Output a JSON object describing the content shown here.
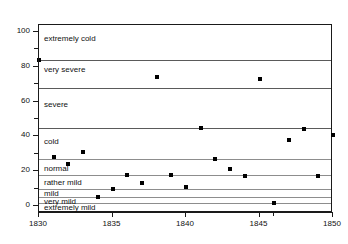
{
  "chart_data": {
    "type": "scatter",
    "title": "",
    "xlabel": "",
    "ylabel": "",
    "xlim": [
      1830,
      1850
    ],
    "ylim": [
      -4,
      104
    ],
    "grid": true,
    "legend": "none",
    "x_ticks": [
      1830,
      1835,
      1840,
      1845,
      1850
    ],
    "x_tick_labels": [
      "1830",
      "1835",
      "1840",
      "1845",
      "1850"
    ],
    "x_minor_ticks": [
      1846
    ],
    "y_ticks": [
      0,
      20,
      40,
      60,
      80,
      100
    ],
    "y_tick_labels": [
      "0",
      "20",
      "40",
      "60",
      "80",
      "100"
    ],
    "y_minor_ticks": [
      10,
      30,
      50,
      70,
      90
    ],
    "x": [
      1830,
      1831,
      1832,
      1833,
      1834,
      1835,
      1836,
      1837,
      1838,
      1839,
      1840,
      1841,
      1842,
      1843,
      1844,
      1845,
      1846,
      1847,
      1848,
      1849,
      1850
    ],
    "values": [
      84,
      28,
      24,
      31,
      5,
      10,
      18,
      13,
      74,
      18,
      11,
      45,
      27,
      21,
      17,
      73,
      2,
      38,
      44,
      17,
      41
    ],
    "points": [
      {
        "x": 1830,
        "y": 84
      },
      {
        "x": 1831,
        "y": 28
      },
      {
        "x": 1832,
        "y": 24
      },
      {
        "x": 1833,
        "y": 31
      },
      {
        "x": 1834,
        "y": 5
      },
      {
        "x": 1835,
        "y": 10
      },
      {
        "x": 1836,
        "y": 18
      },
      {
        "x": 1837,
        "y": 13
      },
      {
        "x": 1838,
        "y": 74
      },
      {
        "x": 1839,
        "y": 18
      },
      {
        "x": 1840,
        "y": 11
      },
      {
        "x": 1841,
        "y": 45
      },
      {
        "x": 1842,
        "y": 27
      },
      {
        "x": 1843,
        "y": 21
      },
      {
        "x": 1844,
        "y": 17
      },
      {
        "x": 1845,
        "y": 73
      },
      {
        "x": 1846,
        "y": 2
      },
      {
        "x": 1847,
        "y": 38
      },
      {
        "x": 1848,
        "y": 44
      },
      {
        "x": 1849,
        "y": 17
      },
      {
        "x": 1850,
        "y": 41
      }
    ],
    "bands": [
      {
        "label": "extremely cold",
        "min": 84,
        "max": 104,
        "label_y": 96
      },
      {
        "label": "very severe",
        "min": 68,
        "max": 84,
        "label_y": 78
      },
      {
        "label": "severe",
        "min": 45,
        "max": 68,
        "label_y": 58
      },
      {
        "label": "cold",
        "min": 27,
        "max": 45,
        "label_y": 37
      },
      {
        "label": "normal",
        "min": 18,
        "max": 27,
        "label_y": 21
      },
      {
        "label": "rather mild",
        "min": 10,
        "max": 18,
        "label_y": 13
      },
      {
        "label": "mild",
        "min": 5,
        "max": 10,
        "label_y": 7
      },
      {
        "label": "very mild",
        "min": 2,
        "max": 5,
        "label_y": 2.6
      },
      {
        "label": "extremely mild",
        "min": -4,
        "max": 2,
        "label_y": -1
      }
    ],
    "band_boundaries": [
      84,
      68,
      45,
      27,
      18,
      10,
      5,
      2
    ],
    "marker_color": "#000000",
    "gridline_color": "#8d8d8d",
    "axis_color": "#1a1a1a"
  }
}
